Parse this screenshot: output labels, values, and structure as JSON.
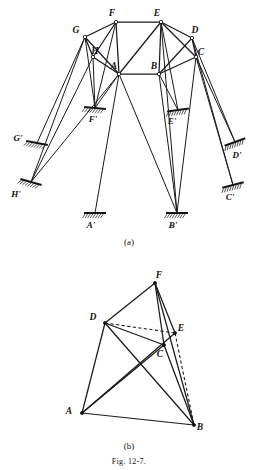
{
  "figure": {
    "caption": "Fig. 12-7.",
    "parts": [
      {
        "id": "a",
        "label": "(a)"
      },
      {
        "id": "b",
        "label": "(b)"
      }
    ]
  },
  "part_a": {
    "name": "truss-support-diagram",
    "joints": [
      {
        "label": "F",
        "x": 116,
        "y": 22,
        "lx": 112,
        "ly": 16,
        "type": "open"
      },
      {
        "label": "E",
        "x": 161,
        "y": 22,
        "lx": 157,
        "ly": 16,
        "type": "open"
      },
      {
        "label": "G",
        "x": 85,
        "y": 37,
        "lx": 76,
        "ly": 33,
        "type": "open"
      },
      {
        "label": "D",
        "x": 192,
        "y": 38,
        "lx": 195,
        "ly": 33,
        "type": "open"
      },
      {
        "label": "H",
        "x": 93,
        "y": 57,
        "lx": 95,
        "ly": 54,
        "type": "open"
      },
      {
        "label": "C",
        "x": 196,
        "y": 57,
        "lx": 201,
        "ly": 55,
        "type": "open"
      },
      {
        "label": "A",
        "x": 119,
        "y": 74,
        "lx": 114,
        "ly": 69,
        "type": "open"
      },
      {
        "label": "B",
        "x": 159,
        "y": 74,
        "lx": 154,
        "ly": 69,
        "type": "open"
      }
    ],
    "supports": [
      {
        "label": "A'",
        "x": 95,
        "y": 213,
        "angle": 0,
        "lx": 91,
        "ly": 228
      },
      {
        "label": "B'",
        "x": 177,
        "y": 213,
        "angle": 0,
        "lx": 173,
        "ly": 228
      },
      {
        "label": "C'",
        "x": 233,
        "y": 185,
        "angle": -14,
        "lx": 230,
        "ly": 200
      },
      {
        "label": "D'",
        "x": 235,
        "y": 142,
        "angle": -20,
        "lx": 237,
        "ly": 158
      },
      {
        "label": "E'",
        "x": 178,
        "y": 110,
        "angle": -8,
        "lx": 172,
        "ly": 124
      },
      {
        "label": "F'",
        "x": 95,
        "y": 108,
        "angle": 5,
        "lx": 93,
        "ly": 122
      },
      {
        "label": "G'",
        "x": 37,
        "y": 143,
        "angle": 10,
        "lx": 18,
        "ly": 141
      },
      {
        "label": "H'",
        "x": 31,
        "y": 182,
        "angle": 16,
        "lx": 16,
        "ly": 197
      }
    ],
    "frame_members": [
      [
        "F",
        "E"
      ],
      [
        "F",
        "G"
      ],
      [
        "E",
        "D"
      ],
      [
        "G",
        "H"
      ],
      [
        "D",
        "C"
      ],
      [
        "H",
        "A"
      ],
      [
        "A",
        "B"
      ],
      [
        "B",
        "C"
      ],
      [
        "F",
        "A"
      ],
      [
        "E",
        "A"
      ],
      [
        "E",
        "B"
      ],
      [
        "E",
        "C"
      ],
      [
        "D",
        "B"
      ],
      [
        "G",
        "A"
      ],
      [
        "H",
        "F"
      ]
    ],
    "support_links": [
      [
        "A",
        "A'"
      ],
      [
        "A",
        "F'"
      ],
      [
        "A",
        "H'"
      ],
      [
        "A",
        "B'"
      ],
      [
        "B",
        "B'"
      ],
      [
        "B",
        "E'"
      ],
      [
        "C",
        "C'"
      ],
      [
        "C",
        "D'"
      ],
      [
        "C",
        "B'"
      ],
      [
        "D",
        "D'"
      ],
      [
        "D",
        "C'"
      ],
      [
        "E",
        "E'"
      ],
      [
        "E",
        "B'"
      ],
      [
        "F",
        "F'"
      ],
      [
        "G",
        "G'"
      ],
      [
        "G",
        "H'"
      ],
      [
        "G",
        "F'"
      ],
      [
        "H",
        "H'"
      ],
      [
        "H",
        "F'"
      ]
    ]
  },
  "part_b": {
    "name": "polygon-diagram",
    "joints": [
      {
        "label": "F",
        "x": 155,
        "y": 283,
        "lx": 159,
        "ly": 278,
        "type": "solid"
      },
      {
        "label": "D",
        "x": 105,
        "y": 323,
        "lx": 93,
        "ly": 320,
        "type": "solid"
      },
      {
        "label": "E",
        "x": 175,
        "y": 333,
        "lx": 181,
        "ly": 331,
        "type": "solid"
      },
      {
        "label": "C",
        "x": 164,
        "y": 345,
        "lx": 160,
        "ly": 357,
        "type": "solid"
      },
      {
        "label": "A",
        "x": 82,
        "y": 413,
        "lx": 69,
        "ly": 414,
        "type": "solid"
      },
      {
        "label": "B",
        "x": 194,
        "y": 425,
        "lx": 200,
        "ly": 430,
        "type": "solid"
      }
    ],
    "solid_members": [
      [
        "A",
        "B"
      ],
      [
        "A",
        "D"
      ],
      [
        "A",
        "C"
      ],
      [
        "A",
        "E"
      ],
      [
        "D",
        "F"
      ],
      [
        "D",
        "C"
      ],
      [
        "D",
        "B"
      ],
      [
        "F",
        "C"
      ],
      [
        "F",
        "E"
      ],
      [
        "F",
        "B"
      ],
      [
        "C",
        "B"
      ]
    ],
    "dashed_members": [
      [
        "D",
        "E"
      ],
      [
        "E",
        "B"
      ]
    ]
  },
  "colors": {
    "ink": "#141414",
    "paper": "#ffffff",
    "hatch": "#2a2a2a"
  }
}
